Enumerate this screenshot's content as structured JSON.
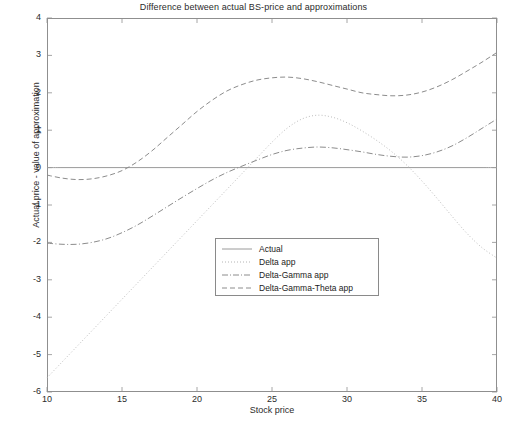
{
  "chart_data": {
    "type": "line",
    "title": "Difference between actual BS-price and approximations",
    "xlabel": "Stock price",
    "ylabel": "Actual price - value of approximation",
    "xlim": [
      10,
      40
    ],
    "ylim": [
      -6,
      4
    ],
    "xticks": [
      10,
      15,
      20,
      25,
      30,
      35,
      40
    ],
    "yticks": [
      4,
      3,
      2,
      1,
      0,
      -1,
      -2,
      -3,
      -4,
      -5,
      -6
    ],
    "grid": false,
    "legend_position": "center",
    "x": [
      10,
      11,
      12,
      13,
      14,
      15,
      16,
      17,
      18,
      19,
      20,
      21,
      22,
      23,
      24,
      25,
      26,
      27,
      28,
      29,
      30,
      31,
      32,
      33,
      34,
      35,
      36,
      37,
      38,
      39,
      40
    ],
    "series": [
      {
        "name": "Actual",
        "style": "solid",
        "values": [
          0,
          0,
          0,
          0,
          0,
          0,
          0,
          0,
          0,
          0,
          0,
          0,
          0,
          0,
          0,
          0,
          0,
          0,
          0,
          0,
          0,
          0,
          0,
          0,
          0,
          0,
          0,
          0,
          0,
          0,
          0
        ]
      },
      {
        "name": "Delta app",
        "style": "dotted",
        "values": [
          -5.62,
          -5.2,
          -4.78,
          -4.36,
          -3.94,
          -3.52,
          -3.1,
          -2.68,
          -2.26,
          -1.84,
          -1.42,
          -1.0,
          -0.58,
          -0.16,
          0.26,
          0.68,
          1.05,
          1.3,
          1.4,
          1.35,
          1.2,
          0.98,
          0.72,
          0.42,
          0.06,
          -0.36,
          -0.82,
          -1.3,
          -1.76,
          -2.14,
          -2.42
        ]
      },
      {
        "name": "Delta-Gamma app",
        "style": "dashdot",
        "values": [
          -2.02,
          -2.05,
          -2.05,
          -2.0,
          -1.9,
          -1.74,
          -1.54,
          -1.3,
          -1.05,
          -0.8,
          -0.56,
          -0.33,
          -0.13,
          0.04,
          0.2,
          0.35,
          0.46,
          0.52,
          0.55,
          0.53,
          0.48,
          0.42,
          0.35,
          0.3,
          0.28,
          0.32,
          0.42,
          0.58,
          0.8,
          1.05,
          1.3
        ]
      },
      {
        "name": "Delta-Gamma-Theta app",
        "style": "dashed",
        "values": [
          -0.2,
          -0.28,
          -0.32,
          -0.3,
          -0.22,
          -0.08,
          0.15,
          0.45,
          0.8,
          1.15,
          1.5,
          1.8,
          2.05,
          2.22,
          2.34,
          2.4,
          2.42,
          2.38,
          2.3,
          2.2,
          2.1,
          2.0,
          1.95,
          1.92,
          1.94,
          2.02,
          2.16,
          2.35,
          2.58,
          2.82,
          3.08
        ]
      }
    ]
  },
  "legend": {
    "entries": [
      {
        "label": "Actual"
      },
      {
        "label": "Delta app"
      },
      {
        "label": "Delta-Gamma app"
      },
      {
        "label": "Delta-Gamma-Theta app"
      }
    ]
  }
}
